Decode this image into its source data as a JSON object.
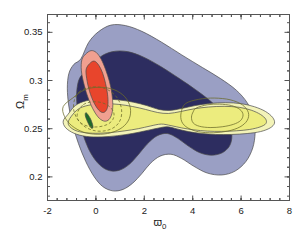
{
  "chart_data": {
    "type": "area",
    "title": "",
    "subtitle": "",
    "xlabel": "w_0",
    "xlabel_base": "ϖ",
    "xlabel_sub": "0",
    "ylabel": "Ω_m",
    "ylabel_base": "Ω",
    "ylabel_sub": "m",
    "xlim": [
      -2.0,
      8.0
    ],
    "ylim": [
      0.1755,
      0.3685
    ],
    "grid": false,
    "legend": null,
    "legend_position": "none",
    "xticks": [
      {
        "value": -2,
        "label": "-2"
      },
      {
        "value": 0,
        "label": "0"
      },
      {
        "value": 2,
        "label": "2"
      },
      {
        "value": 4,
        "label": "4"
      },
      {
        "value": 6,
        "label": "6"
      },
      {
        "value": 8,
        "label": "8"
      }
    ],
    "yticks": [
      {
        "value": 0.2,
        "label": "0.2"
      },
      {
        "value": 0.25,
        "label": "0.25"
      },
      {
        "value": 0.3,
        "label": "0.3"
      },
      {
        "value": 0.35,
        "label": "0.35"
      }
    ],
    "xminor_count": 4,
    "yminor_count": 4,
    "colors": {
      "blue_outer": "#9a9fc4",
      "blue_inner": "#2d2d60",
      "yellow_outer": "#f3f3b8",
      "yellow_inner": "#ecec7e",
      "red_outer": "#f0a090",
      "red_inner": "#e8452c",
      "green_inner": "#1d6b2a",
      "contour_line": "#6b6b2a",
      "frame": "#555555",
      "text": "#1a1a1a"
    },
    "series": [
      {
        "name": "blue-outer-confidence-region",
        "kind": "filled-contour",
        "color": "#9a9fc4",
        "level": "2-sigma",
        "points": [
          [
            -0.62,
            0.3225
          ],
          [
            -0.3,
            0.3395
          ],
          [
            0.1,
            0.3505
          ],
          [
            0.62,
            0.3575
          ],
          [
            1.22,
            0.357
          ],
          [
            1.9,
            0.351
          ],
          [
            2.7,
            0.34
          ],
          [
            3.55,
            0.3265
          ],
          [
            4.4,
            0.3135
          ],
          [
            5.15,
            0.302
          ],
          [
            5.8,
            0.29
          ],
          [
            6.25,
            0.277
          ],
          [
            6.52,
            0.262
          ],
          [
            6.58,
            0.246
          ],
          [
            6.48,
            0.23
          ],
          [
            6.2,
            0.216
          ],
          [
            5.75,
            0.206
          ],
          [
            5.2,
            0.202
          ],
          [
            4.6,
            0.204
          ],
          [
            4.05,
            0.211
          ],
          [
            3.55,
            0.219
          ],
          [
            3.1,
            0.2235
          ],
          [
            2.65,
            0.2215
          ],
          [
            2.25,
            0.214
          ],
          [
            1.9,
            0.2035
          ],
          [
            1.52,
            0.1935
          ],
          [
            1.12,
            0.187
          ],
          [
            0.7,
            0.1855
          ],
          [
            0.28,
            0.19
          ],
          [
            -0.08,
            0.2005
          ],
          [
            -0.42,
            0.216
          ],
          [
            -0.72,
            0.2345
          ],
          [
            -0.96,
            0.254
          ],
          [
            -1.12,
            0.2735
          ],
          [
            -1.18,
            0.292
          ],
          [
            -1.12,
            0.307
          ],
          [
            -0.92,
            0.3165
          ]
        ]
      },
      {
        "name": "blue-inner-confidence-region",
        "kind": "filled-contour",
        "color": "#2d2d60",
        "level": "1-sigma",
        "points": [
          [
            -0.25,
            0.3125
          ],
          [
            0.18,
            0.3245
          ],
          [
            0.7,
            0.33
          ],
          [
            1.3,
            0.33
          ],
          [
            1.95,
            0.3245
          ],
          [
            2.68,
            0.3145
          ],
          [
            3.42,
            0.3025
          ],
          [
            4.12,
            0.2905
          ],
          [
            4.72,
            0.279
          ],
          [
            5.2,
            0.267
          ],
          [
            5.52,
            0.2545
          ],
          [
            5.62,
            0.2425
          ],
          [
            5.52,
            0.232
          ],
          [
            5.22,
            0.225
          ],
          [
            4.78,
            0.2225
          ],
          [
            4.3,
            0.225
          ],
          [
            3.82,
            0.232
          ],
          [
            3.38,
            0.24
          ],
          [
            2.95,
            0.245
          ],
          [
            2.52,
            0.2425
          ],
          [
            2.12,
            0.234
          ],
          [
            1.75,
            0.223
          ],
          [
            1.38,
            0.213
          ],
          [
            0.98,
            0.207
          ],
          [
            0.55,
            0.2065
          ],
          [
            0.15,
            0.2125
          ],
          [
            -0.22,
            0.225
          ],
          [
            -0.52,
            0.243
          ],
          [
            -0.72,
            0.263
          ],
          [
            -0.8,
            0.283
          ],
          [
            -0.72,
            0.2995
          ],
          [
            -0.5,
            0.308
          ]
        ]
      },
      {
        "name": "yellow-outer-confidence-band",
        "kind": "filled-contour",
        "color": "#f3f3b8",
        "level": "2-sigma",
        "points": [
          [
            -1.15,
            0.265
          ],
          [
            -0.85,
            0.274
          ],
          [
            -0.4,
            0.279
          ],
          [
            0.2,
            0.2808
          ],
          [
            0.9,
            0.28
          ],
          [
            1.55,
            0.2775
          ],
          [
            2.1,
            0.274
          ],
          [
            2.6,
            0.27
          ],
          [
            3.05,
            0.269
          ],
          [
            3.55,
            0.271
          ],
          [
            4.1,
            0.274
          ],
          [
            4.7,
            0.2762
          ],
          [
            5.35,
            0.277
          ],
          [
            6.0,
            0.276
          ],
          [
            6.55,
            0.2728
          ],
          [
            7.0,
            0.268
          ],
          [
            7.3,
            0.2618
          ],
          [
            7.38,
            0.2558
          ],
          [
            7.2,
            0.2508
          ],
          [
            6.8,
            0.247
          ],
          [
            6.25,
            0.245
          ],
          [
            5.6,
            0.244
          ],
          [
            4.95,
            0.244
          ],
          [
            4.35,
            0.245
          ],
          [
            3.82,
            0.247
          ],
          [
            3.35,
            0.2498
          ],
          [
            2.95,
            0.252
          ],
          [
            2.55,
            0.2505
          ],
          [
            2.05,
            0.2478
          ],
          [
            1.5,
            0.245
          ],
          [
            0.9,
            0.2428
          ],
          [
            0.25,
            0.2415
          ],
          [
            -0.4,
            0.242
          ],
          [
            -0.9,
            0.2452
          ],
          [
            -1.25,
            0.251
          ],
          [
            -1.35,
            0.258
          ]
        ]
      },
      {
        "name": "yellow-inner-confidence-band",
        "kind": "filled-contour",
        "color": "#ecec7e",
        "level": "1-sigma",
        "points": [
          [
            -0.95,
            0.265
          ],
          [
            -0.65,
            0.2715
          ],
          [
            -0.2,
            0.2748
          ],
          [
            0.35,
            0.276
          ],
          [
            0.95,
            0.2752
          ],
          [
            1.52,
            0.273
          ],
          [
            2.05,
            0.27
          ],
          [
            2.55,
            0.2668
          ],
          [
            3.0,
            0.2658
          ],
          [
            3.5,
            0.2678
          ],
          [
            4.05,
            0.2706
          ],
          [
            4.65,
            0.2725
          ],
          [
            5.3,
            0.2732
          ],
          [
            5.92,
            0.2722
          ],
          [
            6.42,
            0.2692
          ],
          [
            6.8,
            0.2648
          ],
          [
            7.02,
            0.2598
          ],
          [
            7.02,
            0.2552
          ],
          [
            6.78,
            0.2518
          ],
          [
            6.35,
            0.2492
          ],
          [
            5.8,
            0.2478
          ],
          [
            5.2,
            0.2472
          ],
          [
            4.6,
            0.2475
          ],
          [
            4.05,
            0.2488
          ],
          [
            3.55,
            0.2508
          ],
          [
            3.1,
            0.2532
          ],
          [
            2.7,
            0.2548
          ],
          [
            2.25,
            0.2528
          ],
          [
            1.75,
            0.25
          ],
          [
            1.2,
            0.2478
          ],
          [
            0.6,
            0.246
          ],
          [
            0.0,
            0.2452
          ],
          [
            -0.55,
            0.2462
          ],
          [
            -0.95,
            0.2495
          ],
          [
            -1.15,
            0.256
          ]
        ]
      },
      {
        "name": "red-outer-confidence-region",
        "kind": "filled-contour",
        "color": "#f0a090",
        "level": "2-sigma",
        "points": [
          [
            -0.42,
            0.3275
          ],
          [
            -0.2,
            0.331
          ],
          [
            0.02,
            0.329
          ],
          [
            0.22,
            0.322
          ],
          [
            0.4,
            0.3115
          ],
          [
            0.56,
            0.299
          ],
          [
            0.66,
            0.2865
          ],
          [
            0.7,
            0.275
          ],
          [
            0.66,
            0.2655
          ],
          [
            0.54,
            0.2595
          ],
          [
            0.36,
            0.2578
          ],
          [
            0.14,
            0.2608
          ],
          [
            -0.08,
            0.2685
          ],
          [
            -0.3,
            0.2805
          ],
          [
            -0.48,
            0.295
          ],
          [
            -0.6,
            0.31
          ],
          [
            -0.58,
            0.3215
          ]
        ]
      },
      {
        "name": "red-inner-confidence-region",
        "kind": "filled-contour",
        "color": "#e8452c",
        "level": "1-sigma",
        "points": [
          [
            -0.22,
            0.3185
          ],
          [
            -0.05,
            0.32
          ],
          [
            0.12,
            0.3158
          ],
          [
            0.28,
            0.3075
          ],
          [
            0.4,
            0.2968
          ],
          [
            0.48,
            0.2858
          ],
          [
            0.5,
            0.276
          ],
          [
            0.44,
            0.2695
          ],
          [
            0.3,
            0.2668
          ],
          [
            0.12,
            0.2692
          ],
          [
            -0.08,
            0.277
          ],
          [
            -0.26,
            0.2885
          ],
          [
            -0.38,
            0.302
          ],
          [
            -0.4,
            0.312
          ]
        ]
      },
      {
        "name": "green-inner-confidence-region",
        "kind": "filled-contour",
        "color": "#1d6b2a",
        "level": "1-sigma",
        "points": [
          [
            -0.42,
            0.2665
          ],
          [
            -0.34,
            0.265
          ],
          [
            -0.22,
            0.26
          ],
          [
            -0.14,
            0.2546
          ],
          [
            -0.12,
            0.2512
          ],
          [
            -0.18,
            0.2505
          ],
          [
            -0.28,
            0.2538
          ],
          [
            -0.38,
            0.2592
          ],
          [
            -0.44,
            0.2638
          ]
        ]
      }
    ],
    "outline_contours": [
      {
        "name": "dashed-ellipse-upper",
        "kind": "outline",
        "style": "dashed",
        "color": "#6b6b2a",
        "points": [
          [
            -0.7,
            0.288
          ],
          [
            -0.3,
            0.2928
          ],
          [
            0.18,
            0.293
          ],
          [
            0.6,
            0.2888
          ],
          [
            0.92,
            0.2805
          ],
          [
            1.06,
            0.27
          ],
          [
            1.02,
            0.2598
          ],
          [
            0.8,
            0.2522
          ],
          [
            0.42,
            0.248
          ],
          [
            -0.02,
            0.2478
          ],
          [
            -0.44,
            0.2518
          ],
          [
            -0.76,
            0.2598
          ],
          [
            -0.92,
            0.27
          ],
          [
            -0.88,
            0.2805
          ]
        ]
      },
      {
        "name": "solid-ellipse-left-outer",
        "kind": "outline",
        "style": "solid",
        "color": "#6b6b2a",
        "points": [
          [
            -0.95,
            0.282
          ],
          [
            -0.45,
            0.2905
          ],
          [
            0.15,
            0.293
          ],
          [
            0.75,
            0.2905
          ],
          [
            1.2,
            0.283
          ],
          [
            1.42,
            0.272
          ],
          [
            1.38,
            0.2605
          ],
          [
            1.1,
            0.2515
          ],
          [
            0.62,
            0.2458
          ],
          [
            0.05,
            0.2442
          ],
          [
            -0.52,
            0.2465
          ],
          [
            -1.0,
            0.2532
          ],
          [
            -1.3,
            0.2628
          ],
          [
            -1.35,
            0.273
          ]
        ]
      },
      {
        "name": "solid-ellipse-right-outer",
        "kind": "outline",
        "style": "solid",
        "color": "#6b6b2a",
        "points": [
          [
            3.7,
            0.276
          ],
          [
            4.25,
            0.2805
          ],
          [
            4.9,
            0.2818
          ],
          [
            5.55,
            0.28
          ],
          [
            6.05,
            0.2748
          ],
          [
            6.3,
            0.2668
          ],
          [
            6.25,
            0.2585
          ],
          [
            5.95,
            0.2518
          ],
          [
            5.45,
            0.2475
          ],
          [
            4.85,
            0.2458
          ],
          [
            4.25,
            0.2468
          ],
          [
            3.8,
            0.2508
          ],
          [
            3.55,
            0.2572
          ],
          [
            3.52,
            0.2665
          ]
        ]
      },
      {
        "name": "solid-ellipse-right-inner",
        "kind": "outline",
        "style": "solid",
        "color": "#6b6b2a",
        "points": [
          [
            4.15,
            0.2715
          ],
          [
            4.6,
            0.2748
          ],
          [
            5.1,
            0.2755
          ],
          [
            5.6,
            0.274
          ],
          [
            5.95,
            0.27
          ],
          [
            6.08,
            0.2645
          ],
          [
            5.98,
            0.2585
          ],
          [
            5.68,
            0.2545
          ],
          [
            5.22,
            0.252
          ],
          [
            4.72,
            0.2512
          ],
          [
            4.28,
            0.2525
          ],
          [
            4.02,
            0.256
          ],
          [
            3.95,
            0.262
          ],
          [
            4.02,
            0.2675
          ]
        ]
      },
      {
        "name": "dashed-ellipse-lower-left",
        "kind": "outline",
        "style": "dashed",
        "color": "#6b6b2a",
        "points": [
          [
            -0.52,
            0.275
          ],
          [
            -0.18,
            0.2778
          ],
          [
            0.22,
            0.2772
          ],
          [
            0.56,
            0.273
          ],
          [
            0.74,
            0.2665
          ],
          [
            0.7,
            0.2595
          ],
          [
            0.48,
            0.2545
          ],
          [
            0.12,
            0.252
          ],
          [
            -0.26,
            0.2522
          ],
          [
            -0.58,
            0.2552
          ],
          [
            -0.76,
            0.2605
          ],
          [
            -0.74,
            0.268
          ]
        ]
      }
    ]
  }
}
